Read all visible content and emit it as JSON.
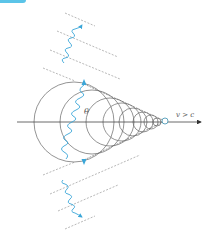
{
  "figure": {
    "labels": {
      "angle": "θ",
      "velocity": "v > c"
    },
    "colors": {
      "axis": "#555555",
      "circles": "#666666",
      "dashed": "#999999",
      "wave": "#3aa6d8",
      "particle_fill": "#ffffff",
      "particle_stroke": "#3a8fb0",
      "tab": "#5bc4e8"
    },
    "axis": {
      "x1": 17,
      "x2": 202,
      "y": 122
    },
    "particle": {
      "x": 165,
      "y": 121,
      "r": 3
    },
    "circles": [
      {
        "cx": 74,
        "r": 40
      },
      {
        "cx": 92,
        "r": 32
      },
      {
        "cx": 110,
        "r": 24
      },
      {
        "cx": 122,
        "r": 19
      },
      {
        "cx": 133,
        "r": 14
      },
      {
        "cx": 143,
        "r": 10
      },
      {
        "cx": 151,
        "r": 7
      },
      {
        "cx": 157,
        "r": 4
      }
    ],
    "icons": {
      "wave_arrow": "wavy-photon-icon",
      "particle": "particle-circle-icon",
      "axis_arrow": "arrow-right-icon"
    }
  }
}
